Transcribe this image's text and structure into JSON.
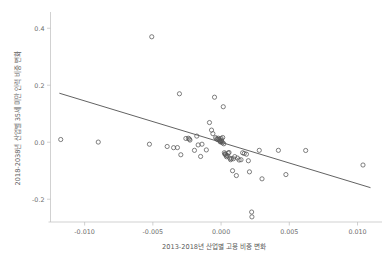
{
  "chart_data": {
    "type": "scatter",
    "title": "",
    "xlabel": "2013-2018년 산업별 고용 비중 변화",
    "ylabel": "2018-2038년 산업별 35세 미만 인력 비중 변화",
    "xlim": [
      -0.0125,
      0.0115
    ],
    "ylim": [
      -0.28,
      0.45
    ],
    "xticks": [
      -0.01,
      -0.005,
      0.0,
      0.005,
      0.01
    ],
    "xticklabels": [
      "-0.010",
      "-0.005",
      "0.000",
      "0.005",
      "0.010"
    ],
    "yticks": [
      -0.2,
      0.0,
      0.2,
      0.4,
      0.6
    ],
    "yticklabels": [
      "-0.2",
      "0.0",
      "0.2",
      "0.4",
      "0.6"
    ],
    "grid": false,
    "legend": null,
    "marker": "open-circle",
    "marker_color": "#555555",
    "trendline": {
      "visible": true,
      "color": "#3a3a3a",
      "x_start": -0.01185,
      "y_start": 0.172,
      "x_end": 0.01095,
      "y_end": -0.1595
    },
    "points": [
      {
        "x": -0.01175,
        "y": 0.0095
      },
      {
        "x": -0.009,
        "y": 0.0005
      },
      {
        "x": -0.00508,
        "y": 0.37
      },
      {
        "x": -0.00525,
        "y": -0.007
      },
      {
        "x": -0.00395,
        "y": -0.015
      },
      {
        "x": -0.00348,
        "y": -0.0192
      },
      {
        "x": -0.00305,
        "y": 0.17
      },
      {
        "x": -0.0032,
        "y": -0.0188
      },
      {
        "x": -0.00295,
        "y": -0.044
      },
      {
        "x": -0.00258,
        "y": 0.0132
      },
      {
        "x": -0.0024,
        "y": 0.014
      },
      {
        "x": -0.00232,
        "y": 0.011
      },
      {
        "x": -0.00228,
        "y": 0.0075
      },
      {
        "x": -0.00195,
        "y": -0.0285
      },
      {
        "x": -0.00178,
        "y": 0.0215
      },
      {
        "x": -0.00168,
        "y": -0.0095
      },
      {
        "x": -0.0015,
        "y": -0.05
      },
      {
        "x": -0.0014,
        "y": -0.007
      },
      {
        "x": -0.00108,
        "y": -0.027
      },
      {
        "x": -0.00085,
        "y": 0.069
      },
      {
        "x": -0.0007,
        "y": 0.0425
      },
      {
        "x": -0.0006,
        "y": 0.03
      },
      {
        "x": -0.00048,
        "y": 0.158
      },
      {
        "x": -0.0004,
        "y": 0.016
      },
      {
        "x": -0.00032,
        "y": 0.0125
      },
      {
        "x": -0.00028,
        "y": 0.0095
      },
      {
        "x": -0.0002,
        "y": 0.0142
      },
      {
        "x": -0.00015,
        "y": 0.0102
      },
      {
        "x": -0.0001,
        "y": 0.0065
      },
      {
        "x": -8e-05,
        "y": 0.003
      },
      {
        "x": -4e-05,
        "y": 0.001
      },
      {
        "x": 0.0,
        "y": 0.0135
      },
      {
        "x": 3e-05,
        "y": 0.0075
      },
      {
        "x": 6e-05,
        "y": 0.002
      },
      {
        "x": 0.0001,
        "y": -0.002
      },
      {
        "x": 0.00012,
        "y": 0.0165
      },
      {
        "x": 0.00016,
        "y": 0.1245
      },
      {
        "x": 0.0002,
        "y": -0.0055
      },
      {
        "x": 0.00024,
        "y": -0.037
      },
      {
        "x": 0.00028,
        "y": -0.042
      },
      {
        "x": 0.00032,
        "y": -0.0415
      },
      {
        "x": 0.00036,
        "y": -0.0455
      },
      {
        "x": 0.0004,
        "y": -0.051
      },
      {
        "x": 0.00046,
        "y": -0.047
      },
      {
        "x": 0.00052,
        "y": -0.0385
      },
      {
        "x": 0.00058,
        "y": -0.036
      },
      {
        "x": 0.00064,
        "y": -0.056
      },
      {
        "x": 0.0007,
        "y": -0.0615
      },
      {
        "x": 0.00076,
        "y": -0.0575
      },
      {
        "x": 0.00084,
        "y": -0.1
      },
      {
        "x": 0.0009,
        "y": -0.058
      },
      {
        "x": 0.001,
        "y": -0.0505
      },
      {
        "x": 0.00112,
        "y": -0.117
      },
      {
        "x": 0.0012,
        "y": -0.0555
      },
      {
        "x": 0.00132,
        "y": -0.0625
      },
      {
        "x": 0.00146,
        "y": -0.0615
      },
      {
        "x": 0.00158,
        "y": -0.037
      },
      {
        "x": 0.0017,
        "y": -0.0395
      },
      {
        "x": 0.00186,
        "y": -0.042
      },
      {
        "x": 0.002,
        "y": -0.065
      },
      {
        "x": 0.00208,
        "y": -0.104
      },
      {
        "x": 0.00224,
        "y": -0.245
      },
      {
        "x": 0.00226,
        "y": -0.262
      },
      {
        "x": 0.0028,
        "y": -0.0285
      },
      {
        "x": 0.003,
        "y": -0.1285
      },
      {
        "x": 0.0042,
        "y": -0.0285
      },
      {
        "x": 0.00475,
        "y": -0.1135
      },
      {
        "x": 0.0062,
        "y": -0.029
      },
      {
        "x": 0.0104,
        "y": -0.08
      }
    ]
  }
}
